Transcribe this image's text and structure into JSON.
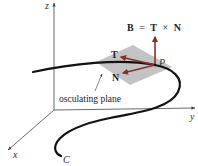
{
  "diagram": {
    "axes": {
      "z_label": "z",
      "y_label": "y",
      "x_label": "x"
    },
    "point_label": "P",
    "curve_label": "C",
    "vectors": {
      "tangent_label": "T",
      "normal_label": "N",
      "binormal_equation": {
        "lhs": "B",
        "equals": "=",
        "t": "T",
        "times": "×",
        "n": "N"
      }
    },
    "plane_label": "osculating plane",
    "colors": {
      "vector": "#8b2e2e",
      "plane": "#b8b8b8",
      "curve": "#111111",
      "axis": "#444444"
    }
  }
}
